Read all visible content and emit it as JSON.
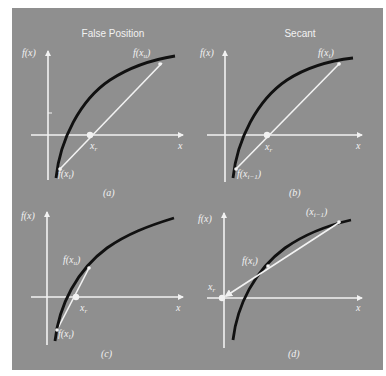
{
  "colors": {
    "background": "#8f8f8f",
    "axis": "#f2f2f2",
    "curve": "#111111",
    "secant": "#f2f2f2",
    "text": "#f2f2f2"
  },
  "panels": [
    {
      "id": "a",
      "title": "False Position",
      "caption": "(a)",
      "y_axis_label": "f(x)",
      "x_axis_label": "x",
      "root_label": "x",
      "root_sub": "r",
      "upper_point_label": "f(x",
      "upper_point_sub": "u",
      "upper_point_close": ")",
      "lower_point_label": "f(x",
      "lower_point_sub": "l",
      "lower_point_close": ")"
    },
    {
      "id": "b",
      "title": "Secant",
      "caption": "(b)",
      "y_axis_label": "f(x)",
      "x_axis_label": "x",
      "root_label": "x",
      "root_sub": "r",
      "upper_point_label": "f(x",
      "upper_point_sub": "i",
      "upper_point_close": ")",
      "lower_point_label": "f(x",
      "lower_point_sub": "i−1",
      "lower_point_close": ")"
    },
    {
      "id": "c",
      "title": "",
      "caption": "(c)",
      "y_axis_label": "f(x)",
      "x_axis_label": "x",
      "root_label": "x",
      "root_sub": "r",
      "upper_point_label": "f(x",
      "upper_point_sub": "u",
      "upper_point_close": ")",
      "lower_point_label": "f(x",
      "lower_point_sub": "l",
      "lower_point_close": ")"
    },
    {
      "id": "d",
      "title": "",
      "caption": "(d)",
      "y_axis_label": "f(x)",
      "x_axis_label": "x",
      "root_label": "x",
      "root_sub": "r",
      "upper_point_label": "(x",
      "upper_point_sub": "i−1",
      "upper_point_close": ")",
      "lower_point_label": "f(x",
      "lower_point_sub": "i",
      "lower_point_close": ")"
    }
  ]
}
